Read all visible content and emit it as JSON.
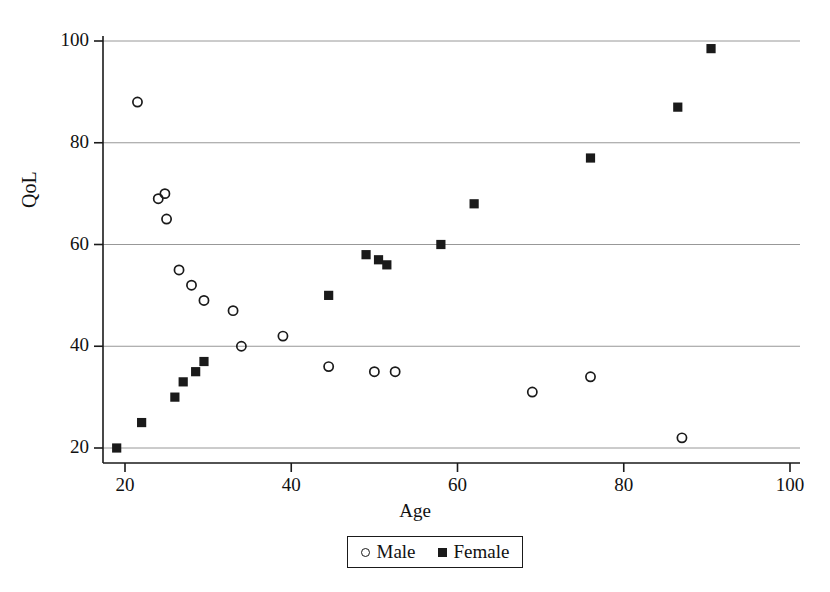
{
  "chart_data": {
    "type": "scatter",
    "title": "",
    "xlabel": "Age",
    "ylabel": "QoL",
    "xlim": [
      18,
      102
    ],
    "ylim": [
      18,
      102
    ],
    "xticks": [
      20,
      40,
      60,
      80,
      100
    ],
    "yticks": [
      20,
      40,
      60,
      80,
      100
    ],
    "grid": "horizontal",
    "legend_position": "bottom-center",
    "series": [
      {
        "name": "Male",
        "marker": "open-circle",
        "color": "#1a1a1a",
        "points": [
          [
            21.5,
            88
          ],
          [
            24.0,
            69
          ],
          [
            24.8,
            70
          ],
          [
            25.0,
            65
          ],
          [
            26.5,
            55
          ],
          [
            28.0,
            52
          ],
          [
            29.5,
            49
          ],
          [
            33.0,
            47
          ],
          [
            34.0,
            40
          ],
          [
            39.0,
            42
          ],
          [
            44.5,
            36
          ],
          [
            50.0,
            35
          ],
          [
            52.5,
            35
          ],
          [
            69.0,
            31
          ],
          [
            76.0,
            34
          ],
          [
            87.0,
            22
          ]
        ]
      },
      {
        "name": "Female",
        "marker": "filled-square",
        "color": "#1a1a1a",
        "points": [
          [
            19.0,
            20
          ],
          [
            22.0,
            25
          ],
          [
            26.0,
            30
          ],
          [
            27.0,
            33
          ],
          [
            28.5,
            35
          ],
          [
            29.5,
            37
          ],
          [
            44.5,
            50
          ],
          [
            49.0,
            58
          ],
          [
            50.5,
            57
          ],
          [
            51.5,
            56
          ],
          [
            58.0,
            60
          ],
          [
            62.0,
            68
          ],
          [
            76.0,
            77
          ],
          [
            86.5,
            87
          ],
          [
            90.5,
            98.5
          ]
        ]
      }
    ]
  },
  "axes": {
    "y_tick_labels": [
      "100",
      "80",
      "60",
      "40",
      "20"
    ],
    "x_tick_labels": [
      "20",
      "40",
      "60",
      "80",
      "100"
    ],
    "ylabel": "QoL",
    "xlabel": "Age"
  },
  "legend": {
    "male_label": "Male",
    "female_label": "Female"
  },
  "colors": {
    "axis": "#1a1a1a",
    "grid": "#8c8c8c",
    "marker": "#1a1a1a",
    "background": "#ffffff"
  }
}
